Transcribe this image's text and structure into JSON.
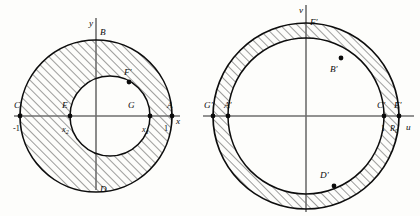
{
  "figure": {
    "background_color": "#fdfdfb",
    "ink_color": "#0d0d0d",
    "axis_color": "#6e6e6e",
    "hatch_color": "#1a1a1a"
  },
  "left_panel": {
    "name": "z-plane",
    "axes": {
      "x_label": "x",
      "y_label": "y"
    },
    "ticks": [
      {
        "label": "-1",
        "axis": "x",
        "value": -1
      },
      {
        "label": "1",
        "axis": "x",
        "value": 1
      },
      {
        "label": "x",
        "sub": "1",
        "axis": "x"
      },
      {
        "label": "x",
        "sub": "2",
        "axis": "x"
      }
    ],
    "points": [
      {
        "label": "A",
        "position": "outer-circle-right",
        "marker": "dot"
      },
      {
        "label": "B",
        "position": "outer-circle-top",
        "marker": "none"
      },
      {
        "label": "C",
        "position": "outer-circle-left",
        "marker": "dot"
      },
      {
        "label": "D",
        "position": "outer-circle-bottom",
        "marker": "none"
      },
      {
        "label": "E",
        "position": "inner-circle-left",
        "marker": "dot"
      },
      {
        "label": "G",
        "position": "inner-circle-right",
        "marker": "dot"
      },
      {
        "label": "F'",
        "position": "inner-circle-upper-right",
        "marker": "dot"
      }
    ],
    "region": {
      "shape": "eccentric annulus",
      "outer_circle": {
        "radius": 1,
        "centered": true
      },
      "inner_circle": {
        "offset": "right of origin",
        "left_edge": "x2",
        "right_edge": "x1"
      },
      "fill": "hatched"
    }
  },
  "right_panel": {
    "name": "w-plane",
    "axes": {
      "x_label": "u",
      "y_label": "v"
    },
    "ticks": [
      {
        "label": "1",
        "axis": "u",
        "value": 1
      },
      {
        "label": "R",
        "sub": "0",
        "axis": "u"
      }
    ],
    "points": [
      {
        "label": "A'",
        "position": "inner-circle-left",
        "marker": "dot"
      },
      {
        "label": "B'",
        "position": "inner-circle-upper-right",
        "marker": "dot"
      },
      {
        "label": "C'",
        "position": "inner-circle-right",
        "marker": "dot"
      },
      {
        "label": "D'",
        "position": "inner-circle-lower-right",
        "marker": "dot"
      },
      {
        "label": "E'",
        "position": "outer-circle-right",
        "marker": "dot"
      },
      {
        "label": "F'",
        "position": "outer-circle-top",
        "marker": "none"
      },
      {
        "label": "G'",
        "position": "outer-circle-left",
        "marker": "dot"
      }
    ],
    "region": {
      "shape": "concentric annulus",
      "inner_radius": 1,
      "outer_radius": "R0",
      "fill": "hatched"
    }
  }
}
